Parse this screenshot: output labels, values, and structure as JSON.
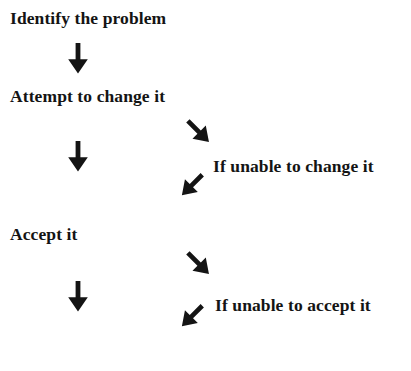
{
  "page": {
    "background_color": "#ffffff",
    "ink_color": "#141414",
    "width": 411,
    "height": 371
  },
  "flow": {
    "steps": [
      {
        "id": "identify",
        "text": "Identify the problem"
      },
      {
        "id": "attempt",
        "text": "Attempt to change it"
      },
      {
        "id": "unable_change",
        "text": "If unable to change it"
      },
      {
        "id": "accept",
        "text": "Accept it"
      },
      {
        "id": "unable_accept",
        "text": "If unable to accept it"
      }
    ],
    "connectors": [
      {
        "id": "v1",
        "direction": "down",
        "glyph": "down-arrow",
        "from": "identify",
        "to": "attempt"
      },
      {
        "id": "d1",
        "direction": "down-right",
        "glyph": "down-right-arrow",
        "from": "attempt",
        "to": "unable_change"
      },
      {
        "id": "v2",
        "direction": "down",
        "glyph": "down-arrow",
        "from": "attempt",
        "to": "accept"
      },
      {
        "id": "l1",
        "direction": "down-left",
        "glyph": "down-left-arrow",
        "from": "unable_change",
        "to": "accept"
      },
      {
        "id": "d2",
        "direction": "down-right",
        "glyph": "down-right-arrow",
        "from": "accept",
        "to": "unable_accept"
      },
      {
        "id": "v3",
        "direction": "down",
        "glyph": "down-arrow",
        "from": "accept",
        "to": "end"
      },
      {
        "id": "l2",
        "direction": "down-left",
        "glyph": "down-left-arrow",
        "from": "unable_accept",
        "to": "end"
      }
    ]
  }
}
